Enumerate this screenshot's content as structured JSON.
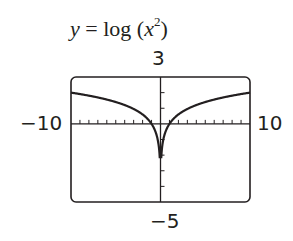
{
  "title": {
    "var": "y",
    "eq": " = log (",
    "xvar": "x",
    "exp": "2",
    "close": ")"
  },
  "window": {
    "ymax_label": "3",
    "ymin_label": "−5",
    "xmin_label": "−10",
    "xmax_label": "10"
  },
  "chart_data": {
    "type": "line",
    "xlabel": "",
    "ylabel": "",
    "xlim": [
      -10,
      10
    ],
    "ylim": [
      -5,
      3
    ],
    "xscale_ticks": 1,
    "yscale_ticks": 1,
    "grid": false,
    "series": [
      {
        "name": "y = log(x^2)",
        "x": [
          -10,
          -8,
          -6,
          -4,
          -2,
          -1,
          -0.5,
          -0.1,
          0.1,
          0.5,
          1,
          2,
          4,
          6,
          8,
          10
        ],
        "y": [
          2,
          1.81,
          1.56,
          1.2,
          0.6,
          0,
          -0.6,
          -2,
          -2,
          -0.6,
          0,
          0.6,
          1.2,
          1.56,
          1.81,
          2
        ]
      }
    ],
    "colors": {
      "curve": "#231f20",
      "frame": "#231f20"
    }
  }
}
